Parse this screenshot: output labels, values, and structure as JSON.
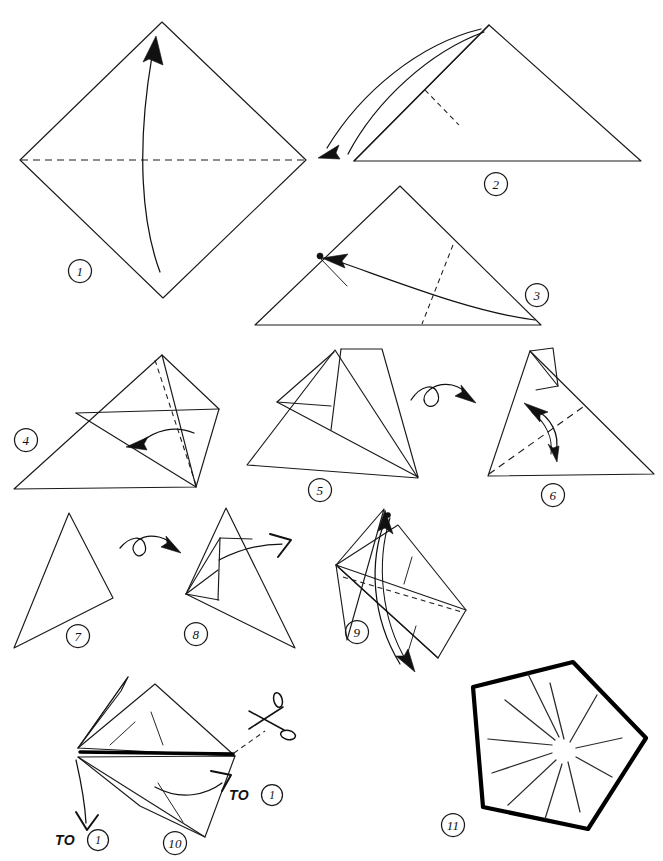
{
  "document": {
    "kind": "origami-folding-instructions",
    "title": "Origami folding sequence",
    "page_width": 663,
    "page_height": 861,
    "background_color": "#ffffff",
    "ink_color": "#111111",
    "line_styles": {
      "solid_edge": "solid paper edge",
      "dashed_line": "dashed fold / crease line",
      "bold_line": "bold cut edge",
      "curved_arrow": "fold direction arrow",
      "loop_arrow": "turn over arrow",
      "open_arrow": "open / unfold arrow"
    }
  },
  "steps": [
    {
      "number": "1",
      "badge_label": "1",
      "shape": "square rotated 45 degrees (diamond)",
      "annotations": [
        "horizontal dashed crease across the middle",
        "curved arrow from bottom vertex up to top vertex"
      ],
      "badge_x": 80,
      "badge_y": 271
    },
    {
      "number": "2",
      "badge_label": "2",
      "shape": "wide triangle, apex at top",
      "annotations": [
        "short dashed crease below the apex",
        "long double curved arrow from apex swinging to the left corner"
      ],
      "badge_x": 496,
      "badge_y": 184
    },
    {
      "number": "3",
      "badge_label": "3",
      "shape": "wide low triangle",
      "annotations": [
        "dashed crease dropping from the right edge to the base",
        "curved arrow from bottom-right corner to a marked dot on the left edge",
        "small tick pointing to the dot"
      ],
      "badge_x": 537,
      "badge_y": 295
    },
    {
      "number": "4",
      "badge_label": "4",
      "shape": "triangle with folded flap overlay",
      "annotations": [
        "dashed crease from apex to bottom-right corner",
        "short curved arrow pointing left"
      ],
      "badge_x": 26,
      "badge_y": 440
    },
    {
      "number": "5",
      "badge_label": "5",
      "shape": "triangle with tall quadrilateral flap standing above it",
      "annotations": [
        "loop turn-over arrow to the right of the model"
      ],
      "badge_x": 320,
      "badge_y": 490
    },
    {
      "number": "6",
      "badge_label": "6",
      "shape": "triangle with small flap at the top-left",
      "annotations": [
        "dashed crease from bottom-left corner to the right edge",
        "double-headed curved arrow crossing the crease"
      ],
      "badge_x": 553,
      "badge_y": 495
    },
    {
      "number": "7",
      "badge_label": "7",
      "shape": "narrow slim triangle",
      "annotations": [
        "loop turn-over arrow to the right of the model"
      ],
      "badge_x": 78,
      "badge_y": 636
    },
    {
      "number": "8",
      "badge_label": "8",
      "shape": "slim triangle with pleat lines along the left edge",
      "annotations": [
        "open hollow arrow pointing up to the right"
      ],
      "badge_x": 196,
      "badge_y": 634
    },
    {
      "number": "9",
      "badge_label": "9",
      "shape": "kite / rhombus of layered flaps",
      "annotations": [
        "dashed crease across the middle",
        "long double-headed curved arrow from the top point down past the bottom point"
      ],
      "badge_x": 357,
      "badge_y": 632
    },
    {
      "number": "10",
      "badge_label": "10",
      "shape": "layered kite with bold cut edge",
      "annotations": [
        "scissors symbol on a dashed cut line",
        "bold black cut edge",
        "curved arrow to the right labelled TO 1",
        "curved arrow down-left labelled TO 1"
      ],
      "badge_x": 175,
      "badge_y": 843
    },
    {
      "number": "11",
      "badge_label": "11",
      "shape": "finished bold pentagon",
      "annotations": [
        "radiating starburst of creases from the centre"
      ],
      "badge_x": 453,
      "badge_y": 825
    }
  ],
  "callouts": [
    {
      "id": "to-one-right",
      "text": "TO",
      "badge": "1",
      "x": 239,
      "y": 795
    },
    {
      "id": "to-one-left",
      "text": "TO",
      "badge": "1",
      "x": 65,
      "y": 840
    }
  ],
  "icons": {
    "scissors": "scissors-icon",
    "turn_over": "turn-over-loop-icon",
    "fold_arrow": "fold-arrow-icon",
    "open_arrow": "open-arrow-icon",
    "reference_dot": "reference-point-dot"
  },
  "final_shape": {
    "name": "pentagon",
    "sides": 5,
    "burst_line_count": 11,
    "stroke": "#000000"
  }
}
